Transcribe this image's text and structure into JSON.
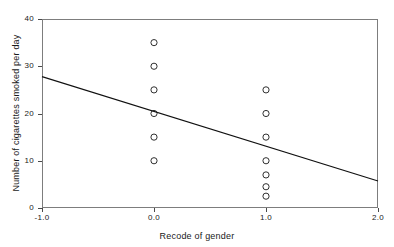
{
  "chart_data": {
    "type": "scatter",
    "title": "",
    "xlabel": "Recode of gender",
    "ylabel": "Number of cigarettes smoked per day",
    "xlim": [
      -1.0,
      2.0
    ],
    "ylim": [
      0,
      40
    ],
    "xticks": [
      -1.0,
      0.0,
      1.0,
      2.0
    ],
    "xtick_labels": [
      "-1.0",
      "0.0",
      "1.0",
      "2.0"
    ],
    "yticks": [
      0,
      10,
      20,
      30,
      40
    ],
    "ytick_labels": [
      "0",
      "10",
      "20",
      "30",
      "40"
    ],
    "grid": false,
    "legend": null,
    "marker": "open-circle",
    "points": [
      {
        "x": 0.0,
        "y": 35
      },
      {
        "x": 0.0,
        "y": 30
      },
      {
        "x": 0.0,
        "y": 25
      },
      {
        "x": 0.0,
        "y": 20
      },
      {
        "x": 0.0,
        "y": 15
      },
      {
        "x": 0.0,
        "y": 10
      },
      {
        "x": 1.0,
        "y": 25
      },
      {
        "x": 1.0,
        "y": 20
      },
      {
        "x": 1.0,
        "y": 15
      },
      {
        "x": 1.0,
        "y": 10
      },
      {
        "x": 1.0,
        "y": 7
      },
      {
        "x": 1.0,
        "y": 4.5
      },
      {
        "x": 1.0,
        "y": 2.5
      }
    ],
    "fit_line": {
      "name": "linear-fit",
      "x_start": -1.0,
      "y_start": 27.8,
      "x_end": 2.0,
      "y_end": 5.7,
      "slope": -7.37,
      "intercept": 20.43
    },
    "colors": {
      "axis": "#7d7d7d",
      "tick": "#4a4a4a",
      "marker": "#1a1a1a",
      "fit_line": "#111111",
      "background": "#ffffff",
      "text": "#1a1a1a"
    }
  }
}
